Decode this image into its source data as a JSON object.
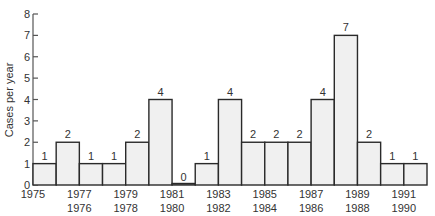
{
  "chart_data": {
    "type": "bar",
    "title": "",
    "xlabel": "",
    "ylabel": "Cases per year",
    "ylim": [
      0,
      8
    ],
    "yticks": [
      0,
      1,
      2,
      3,
      4,
      5,
      6,
      7,
      8
    ],
    "grid": false,
    "legend": null,
    "categories": [
      "1975",
      "1976",
      "1977",
      "1978",
      "1979",
      "1980",
      "1981",
      "1982",
      "1983",
      "1984",
      "1985",
      "1986",
      "1987",
      "1988",
      "1989",
      "1990",
      "1991"
    ],
    "values": [
      1,
      2,
      1,
      1,
      2,
      4,
      0,
      1,
      4,
      2,
      2,
      2,
      4,
      7,
      2,
      1,
      1
    ],
    "data_labels": true,
    "x_label_layout": "staggered-two-rows"
  }
}
